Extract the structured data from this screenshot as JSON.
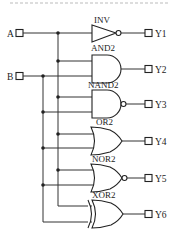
{
  "diagram": {
    "type": "logic-circuit",
    "inputs": [
      {
        "id": "A",
        "label": "A"
      },
      {
        "id": "B",
        "label": "B"
      }
    ],
    "gates": [
      {
        "id": "g1",
        "type": "INV",
        "label": "INV",
        "inputs": [
          "A"
        ],
        "output": "Y1"
      },
      {
        "id": "g2",
        "type": "AND2",
        "label": "AND2",
        "inputs": [
          "A",
          "B"
        ],
        "output": "Y2"
      },
      {
        "id": "g3",
        "type": "NAND2",
        "label": "NAND2",
        "inputs": [
          "A",
          "B"
        ],
        "output": "Y3"
      },
      {
        "id": "g4",
        "type": "OR2",
        "label": "OR2",
        "inputs": [
          "A",
          "B"
        ],
        "output": "Y4"
      },
      {
        "id": "g5",
        "type": "NOR2",
        "label": "NOR2",
        "inputs": [
          "A",
          "B"
        ],
        "output": "Y5"
      },
      {
        "id": "g6",
        "type": "XOR2",
        "label": "XOR2",
        "inputs": [
          "A",
          "B"
        ],
        "output": "Y6"
      }
    ],
    "outputs": [
      {
        "id": "Y1",
        "label": "Y1"
      },
      {
        "id": "Y2",
        "label": "Y2"
      },
      {
        "id": "Y3",
        "label": "Y3"
      },
      {
        "id": "Y4",
        "label": "Y4"
      },
      {
        "id": "Y5",
        "label": "Y5"
      },
      {
        "id": "Y6",
        "label": "Y6"
      }
    ],
    "colors": {
      "line": "#222222",
      "background": "#ffffff"
    }
  }
}
